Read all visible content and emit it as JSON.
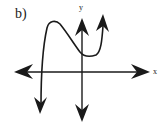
{
  "part_label": "b)",
  "axes": {
    "x_label": "x",
    "y_label": "y"
  },
  "diagram": {
    "type": "function-sketch",
    "colors": {
      "stroke": "#1a1a1a",
      "background": "#ffffff"
    }
  }
}
